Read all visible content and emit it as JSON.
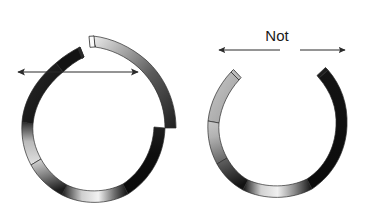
{
  "figure": {
    "background_color": "#ffffff",
    "width": 372,
    "height": 211,
    "panels": [
      {
        "id": "correct-ring",
        "name": "helical-split-ring",
        "label": "",
        "description": "Split ring with axially offset gap ends",
        "gap_style": "offset",
        "gap_orientation": "top",
        "annotation": {
          "type": "vertical-double-arrow",
          "name": "axial-offset-arrow",
          "direction": "up-down",
          "label": ""
        },
        "ring": {
          "center_x": 93,
          "center_y": 118,
          "radius_x": 72,
          "radius_y": 83,
          "band_thickness": 11
        }
      },
      {
        "id": "incorrect-ring",
        "name": "planar-split-ring",
        "label": "Not",
        "description": "Split ring with coplanar aligned gap ends",
        "gap_style": "aligned",
        "gap_orientation": "top",
        "annotation": {
          "type": "horizontal-outward-arrows",
          "name": "spread-arrows",
          "direction": "left-right",
          "label": "Not"
        },
        "ring": {
          "center_x": 277,
          "center_y": 118,
          "radius_x": 70,
          "radius_y": 77,
          "band_thickness": 11
        }
      }
    ],
    "colors": {
      "ink": "#1a1a1a",
      "shade_dark": "#0a0a0a",
      "shade_mid": "#6e6e6e",
      "shade_light": "#e8e8e8",
      "outline": "#2b2b2b",
      "arrow": "#2b2b2b",
      "background": "#ffffff"
    }
  }
}
